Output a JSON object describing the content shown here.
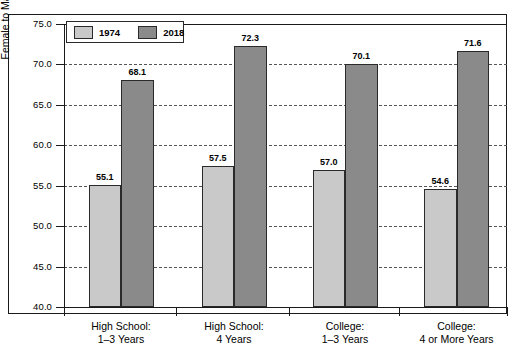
{
  "chart_data": {
    "type": "bar",
    "title": "",
    "xlabel": "",
    "ylabel": "Female to Male Ratio (%)",
    "ylim": [
      40.0,
      75.0
    ],
    "ytick_step": 5.0,
    "yticks": [
      "75.0",
      "70.0",
      "65.0",
      "60.0",
      "55.0",
      "50.0",
      "45.0",
      "40.0"
    ],
    "grid": true,
    "legend_position": "top-left inside plot",
    "categories": [
      {
        "line1": "High School:",
        "line2": "1–3 Years"
      },
      {
        "line1": "High School:",
        "line2": "4 Years"
      },
      {
        "line1": "College:",
        "line2": "1–3 Years"
      },
      {
        "line1": "College:",
        "line2": "4 or More Years"
      }
    ],
    "series": [
      {
        "name": "1974",
        "color": "#c9c9c9",
        "values": [
          55.1,
          57.5,
          57.0,
          54.6
        ],
        "labels": [
          "55.1",
          "57.5",
          "57.0",
          "54.6"
        ]
      },
      {
        "name": "2018",
        "color": "#8a8a8a",
        "values": [
          68.1,
          72.3,
          70.1,
          71.6
        ],
        "labels": [
          "68.1",
          "72.3",
          "70.1",
          "71.6"
        ]
      }
    ]
  },
  "legend": {
    "item1_label": "1974",
    "item2_label": "2018"
  },
  "axes": {
    "y_title": "Female to Male Ratio (%)"
  }
}
